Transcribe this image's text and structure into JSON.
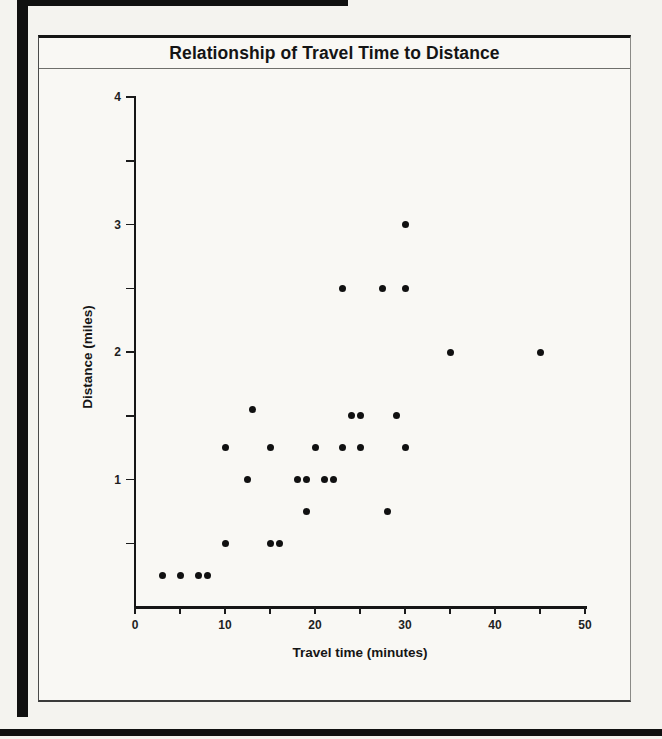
{
  "page": {
    "kind": "scanned textbook scatter plot"
  },
  "colors": {
    "ink": "#161616",
    "paper": "#f4f3ef",
    "box_paper": "#f9f8f4",
    "edge_bar": "#101010"
  },
  "chart_data": {
    "type": "scatter",
    "title": "Relationship of Travel Time to Distance",
    "xlabel": "Travel time (minutes)",
    "ylabel": "Distance (miles)",
    "xlim": [
      0,
      50
    ],
    "ylim": [
      0,
      4
    ],
    "x_minor_tick_step": 5,
    "x_label_step": 10,
    "y_minor_tick_step": 0.5,
    "y_label_step": 1,
    "x_tick_labels": [
      "0",
      "10",
      "20",
      "30",
      "40",
      "50"
    ],
    "y_tick_labels": [
      "1",
      "2",
      "3",
      "4"
    ],
    "origin_label": "0",
    "grid": false,
    "legend": null,
    "marker": {
      "shape": "circle",
      "color": "#111111",
      "diameter_px": 7
    },
    "points": [
      [
        3,
        0.25
      ],
      [
        5,
        0.25
      ],
      [
        7,
        0.25
      ],
      [
        8,
        0.25
      ],
      [
        10,
        0.5
      ],
      [
        10,
        1.25
      ],
      [
        12.5,
        1.0
      ],
      [
        13,
        1.55
      ],
      [
        15,
        0.5
      ],
      [
        15,
        1.25
      ],
      [
        16,
        0.5
      ],
      [
        18,
        1.0
      ],
      [
        19,
        0.75
      ],
      [
        19,
        1.0
      ],
      [
        20,
        1.25
      ],
      [
        21,
        1.0
      ],
      [
        22,
        1.0
      ],
      [
        23,
        1.25
      ],
      [
        23,
        2.5
      ],
      [
        24,
        1.5
      ],
      [
        25,
        1.25
      ],
      [
        25,
        1.5
      ],
      [
        27.5,
        2.5
      ],
      [
        28,
        0.75
      ],
      [
        29,
        1.5
      ],
      [
        30,
        1.25
      ],
      [
        30,
        2.5
      ],
      [
        30,
        3.0
      ],
      [
        35,
        2.0
      ],
      [
        45,
        2.0
      ]
    ]
  }
}
